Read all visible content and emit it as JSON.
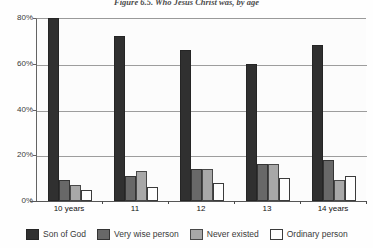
{
  "figure": {
    "title": "Figure 6.5. Who Jesus Christ was, by age"
  },
  "chart_data": {
    "type": "bar",
    "title": "Figure 6.5. Who Jesus Christ was, by age",
    "xlabel": "",
    "ylabel": "",
    "ylim": [
      0,
      80
    ],
    "ytick_labels": [
      "0%",
      "20%",
      "40%",
      "60%",
      "80%"
    ],
    "ytick_values": [
      0,
      20,
      40,
      60,
      80
    ],
    "grid": true,
    "legend_position": "bottom",
    "categories": [
      "10 years",
      "11",
      "12",
      "13",
      "14 years"
    ],
    "series": [
      {
        "name": "Son of God",
        "color": "#0d0d0d",
        "values": [
          80,
          72,
          66,
          60,
          68
        ]
      },
      {
        "name": "Very wise person",
        "color": "#4f4f4f",
        "values": [
          9,
          11,
          14,
          16,
          18
        ]
      },
      {
        "name": "Never existed",
        "color": "#9b9b9b",
        "values": [
          7,
          13,
          14,
          16,
          9
        ]
      },
      {
        "name": "Ordinary person",
        "color": "#ffffff",
        "values": [
          5,
          6,
          8,
          10,
          11
        ]
      }
    ]
  },
  "legend": {
    "items": [
      {
        "label": "Son of God"
      },
      {
        "label": "Very wise person"
      },
      {
        "label": "Never existed"
      },
      {
        "label": "Ordinary person"
      }
    ]
  }
}
